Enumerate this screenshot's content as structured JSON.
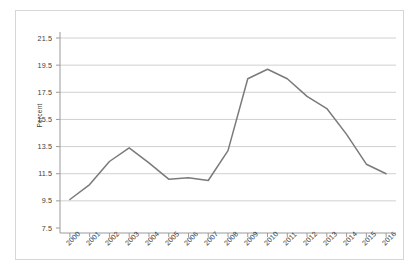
{
  "chart_data": {
    "type": "line",
    "title": "",
    "xlabel": "",
    "ylabel": "Percent",
    "grid": true,
    "legend": false,
    "ylim": [
      7.5,
      21.5
    ],
    "ytick_labels": [
      "21.5",
      "19.5",
      "17.5",
      "15.5",
      "13.5",
      "11.5",
      "9.5",
      "7.5"
    ],
    "ytick_values": [
      21.5,
      19.5,
      17.5,
      15.5,
      13.5,
      11.5,
      9.5,
      7.5
    ],
    "categories": [
      "2000",
      "2001",
      "2002",
      "2003",
      "2004",
      "2005",
      "2006",
      "2007",
      "2008",
      "2009",
      "2010",
      "2011",
      "2012",
      "2013",
      "2014",
      "2015",
      "2016"
    ],
    "x": [
      2000,
      2001,
      2002,
      2003,
      2004,
      2005,
      2006,
      2007,
      2008,
      2009,
      2010,
      2011,
      2012,
      2013,
      2014,
      2015,
      2016
    ],
    "values": [
      9.6,
      10.7,
      12.4,
      13.4,
      12.3,
      11.1,
      11.2,
      11.0,
      13.2,
      18.5,
      19.2,
      18.5,
      17.2,
      16.3,
      14.4,
      12.2,
      11.5
    ],
    "series": [
      {
        "name": "Percent",
        "color": "#7a7a7a",
        "values": [
          9.6,
          10.7,
          12.4,
          13.4,
          12.3,
          11.1,
          11.2,
          11.0,
          13.2,
          18.5,
          19.2,
          18.5,
          17.2,
          16.3,
          14.4,
          12.2,
          11.5
        ]
      }
    ]
  },
  "colors": {
    "line": "#7a7a7a",
    "grid": "#d0d0d0",
    "axis": "#9a9a9a",
    "frame": "#d6d6d6",
    "text": "#3d3d3d",
    "background": "#ffffff"
  }
}
